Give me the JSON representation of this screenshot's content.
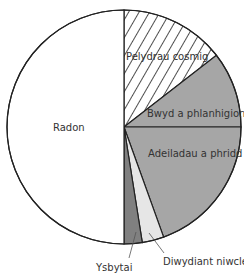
{
  "chart_data": {
    "type": "pie",
    "title": "",
    "start_angle_deg": 0,
    "direction": "clockwise",
    "slices": [
      {
        "label": "Pelydrau cosmig",
        "value": 14.5,
        "fill": "hatch",
        "color": "#ffffff"
      },
      {
        "label": "Bwyd a phlanhigion",
        "value": 10.5,
        "fill": "solid",
        "color": "#a6a6a6"
      },
      {
        "label": "Adeiladau a phridd",
        "value": 19.5,
        "fill": "solid",
        "color": "#a6a6a6"
      },
      {
        "label": "Diwydiant niwclear",
        "value": 3,
        "fill": "solid",
        "color": "#e6e6e6"
      },
      {
        "label": "Ysbytai",
        "value": 2.5,
        "fill": "solid",
        "color": "#808080"
      },
      {
        "label": "Radon",
        "value": 50,
        "fill": "solid",
        "color": "#ffffff"
      }
    ],
    "labels": {
      "cosmic": "Pelydrau cosmig",
      "food": "Bwyd a phlanhigion",
      "buildings": "Adeiladau a phridd",
      "nuclear": "Diwydiant niwclear",
      "hospitals": "Ysbytai",
      "radon": "Radon"
    }
  }
}
